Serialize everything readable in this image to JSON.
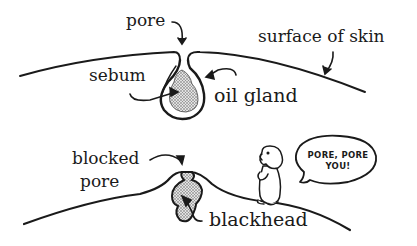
{
  "diagram": {
    "top_panel": {
      "labels": {
        "pore": "pore",
        "surface_of_skin": "surface of skin",
        "sebum": "sebum",
        "oil_gland": "oil gland"
      }
    },
    "bottom_panel": {
      "labels": {
        "blocked_pore_line1": "blocked",
        "blocked_pore_line2": "pore",
        "blackhead": "blackhead"
      },
      "speech_bubble": {
        "line1": "PORE, PORE",
        "line2": "YOU!"
      }
    },
    "colors": {
      "ink": "#1a1a1a",
      "stipple": "#bdbdbd",
      "background": "#ffffff"
    }
  }
}
